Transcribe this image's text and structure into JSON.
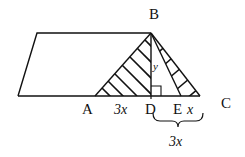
{
  "diagram": {
    "type": "geometry",
    "colors": {
      "stroke": "#111111",
      "background": "#ffffff"
    },
    "points": {
      "A": "A",
      "B": "B",
      "C": "C",
      "D": "D",
      "E": "E"
    },
    "labels": {
      "AD": "3x",
      "EC": "x",
      "DC_brace": "3x",
      "BD": "y"
    }
  }
}
